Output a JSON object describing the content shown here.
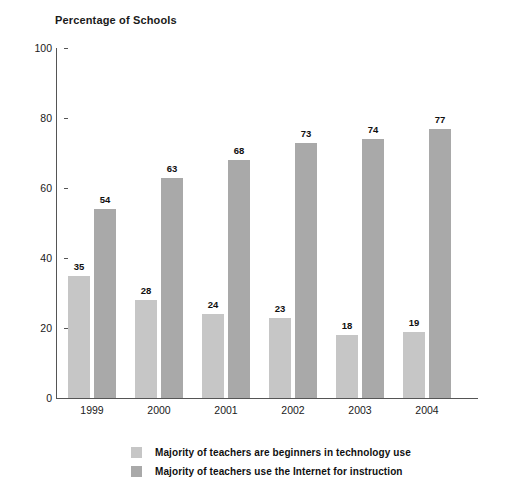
{
  "chart_data": {
    "type": "bar",
    "title": "Percentage of Schools",
    "xlabel": "",
    "ylabel": "",
    "ylim": [
      0,
      100
    ],
    "yticks": [
      0,
      20,
      40,
      60,
      80,
      100
    ],
    "grid": false,
    "legend_position": "bottom",
    "categories": [
      "1999",
      "2000",
      "2001",
      "2002",
      "2003",
      "2004"
    ],
    "series": [
      {
        "name": "Majority of teachers are beginners in technology use",
        "color": "#c6c6c6",
        "values": [
          35,
          28,
          24,
          23,
          18,
          19
        ]
      },
      {
        "name": "Majority of teachers use the Internet for instruction",
        "color": "#a9a9a9",
        "values": [
          54,
          63,
          68,
          73,
          74,
          77
        ]
      }
    ]
  },
  "axis": {
    "y_tick_labels": [
      "100",
      "80",
      "60",
      "40",
      "20",
      "0"
    ],
    "x_tick_labels": [
      "1999",
      "2000",
      "2001",
      "2002",
      "2003",
      "2004"
    ]
  },
  "legend": {
    "items": [
      {
        "label": "Majority of teachers are beginners in technology use",
        "swatch": "series-a"
      },
      {
        "label": "Majority of teachers use the Internet for instruction",
        "swatch": "series-b"
      }
    ]
  },
  "values_series_a": [
    "35",
    "28",
    "24",
    "23",
    "18",
    "19"
  ],
  "values_series_b": [
    "54",
    "63",
    "68",
    "73",
    "74",
    "77"
  ]
}
